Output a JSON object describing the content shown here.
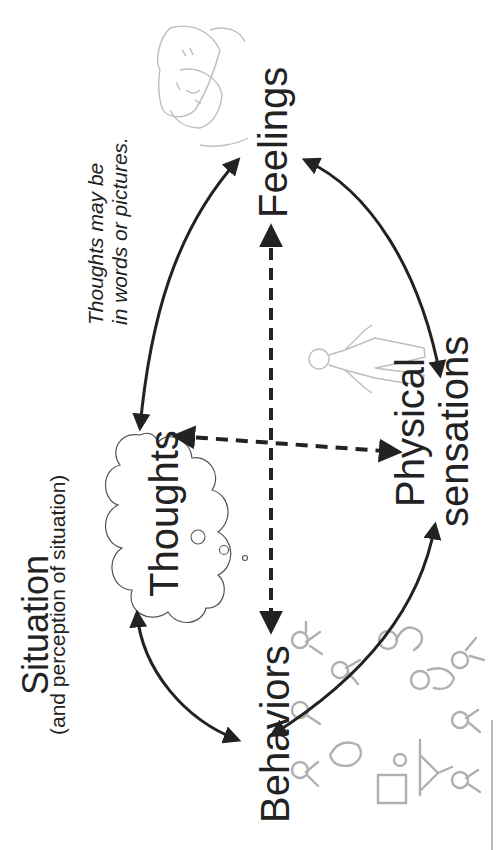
{
  "diagram": {
    "type": "cognitive-behavioral model (rotated 90° counter-clockwise)",
    "title": "Situation",
    "subtitle": "(and perception of situation)",
    "note_line1": "Thoughts may be",
    "note_line2": "in words or pictures.",
    "nodes": {
      "thoughts": "Thoughts",
      "feelings": "Feelings",
      "behaviors": "Behaviors",
      "physical_line1": "Physical",
      "physical_line2": "sensations"
    },
    "connections": [
      {
        "from": "Thoughts",
        "to": "Feelings",
        "style": "solid",
        "direction": "bidirectional"
      },
      {
        "from": "Feelings",
        "to": "Physical sensations",
        "style": "solid",
        "direction": "bidirectional"
      },
      {
        "from": "Physical sensations",
        "to": "Behaviors",
        "style": "solid",
        "direction": "bidirectional"
      },
      {
        "from": "Behaviors",
        "to": "Thoughts",
        "style": "solid",
        "direction": "bidirectional"
      },
      {
        "from": "Feelings",
        "to": "Behaviors",
        "style": "dashed",
        "direction": "bidirectional"
      },
      {
        "from": "Thoughts",
        "to": "Physical sensations",
        "style": "dashed",
        "direction": "bidirectional"
      }
    ],
    "illustrations": [
      "theater-masks",
      "human-body-outline",
      "activity-clipart",
      "thought-cloud"
    ],
    "colors": {
      "ink": "#222222",
      "clipart": "#b0b0b0",
      "outline": "#555555"
    }
  }
}
